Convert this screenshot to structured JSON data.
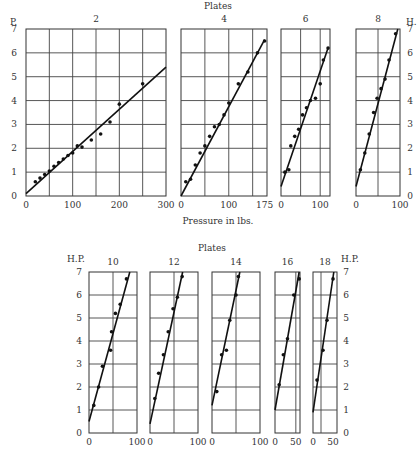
{
  "figure": {
    "top_title": "Plates",
    "bottom_title": "Plates",
    "x_axis_label": "Pressure in lbs.",
    "top_left_axis_label": "P.",
    "top_right_axis_label": "H.",
    "bottom_left_axis_label": "H.P.",
    "bottom_right_axis_label": "H.P.",
    "y_ticks": [
      "0",
      "1",
      "2",
      "3",
      "4",
      "5",
      "6",
      "7"
    ]
  },
  "chart_data": [
    {
      "type": "scatter",
      "title": "2",
      "xlabel": "Pressure in lbs.",
      "ylabel": "P.",
      "xlim": [
        0,
        300
      ],
      "ylim": [
        0,
        7
      ],
      "x_tick_labels": [
        "0",
        "100",
        "200",
        "300"
      ],
      "x_grid": [
        50,
        100,
        150,
        200,
        250
      ],
      "grid": true,
      "points": [
        [
          20,
          0.6
        ],
        [
          30,
          0.75
        ],
        [
          40,
          0.9
        ],
        [
          50,
          1.05
        ],
        [
          60,
          1.25
        ],
        [
          70,
          1.4
        ],
        [
          80,
          1.55
        ],
        [
          90,
          1.7
        ],
        [
          100,
          1.8
        ],
        [
          110,
          2.1
        ],
        [
          120,
          2.05
        ],
        [
          140,
          2.35
        ],
        [
          160,
          2.6
        ],
        [
          180,
          3.1
        ],
        [
          200,
          3.85
        ],
        [
          250,
          4.7
        ]
      ],
      "fit_line": [
        [
          0,
          0.1
        ],
        [
          300,
          5.4
        ]
      ]
    },
    {
      "type": "scatter",
      "title": "4",
      "xlabel": "Pressure in lbs.",
      "xlim": [
        0,
        180
      ],
      "ylim": [
        0,
        7
      ],
      "x_tick_labels": [
        "0",
        "100",
        "175"
      ],
      "x_grid": [
        50,
        100,
        150
      ],
      "grid": true,
      "points": [
        [
          10,
          0.6
        ],
        [
          20,
          0.7
        ],
        [
          30,
          1.3
        ],
        [
          40,
          1.8
        ],
        [
          50,
          2.1
        ],
        [
          60,
          2.5
        ],
        [
          70,
          2.9
        ],
        [
          80,
          3.0
        ],
        [
          90,
          3.4
        ],
        [
          100,
          3.9
        ],
        [
          120,
          4.7
        ],
        [
          140,
          5.2
        ],
        [
          160,
          6.0
        ],
        [
          175,
          6.5
        ]
      ],
      "fit_line": [
        [
          0,
          0.0
        ],
        [
          175,
          6.55
        ]
      ]
    },
    {
      "type": "scatter",
      "title": "6",
      "xlabel": "Pressure in lbs.",
      "xlim": [
        0,
        125
      ],
      "ylim": [
        0,
        7
      ],
      "x_tick_labels": [
        "0",
        "100"
      ],
      "x_grid": [
        50,
        100
      ],
      "grid": true,
      "points": [
        [
          10,
          1.0
        ],
        [
          20,
          1.1
        ],
        [
          25,
          2.1
        ],
        [
          35,
          2.5
        ],
        [
          45,
          2.8
        ],
        [
          55,
          3.4
        ],
        [
          65,
          3.7
        ],
        [
          75,
          4.0
        ],
        [
          88,
          4.1
        ],
        [
          100,
          4.7
        ],
        [
          108,
          5.7
        ],
        [
          120,
          6.2
        ]
      ],
      "fit_line": [
        [
          0,
          0.4
        ],
        [
          120,
          6.2
        ]
      ]
    },
    {
      "type": "scatter",
      "title": "8",
      "xlabel": "Pressure in lbs.",
      "xlim": [
        0,
        100
      ],
      "ylim": [
        0,
        7
      ],
      "x_tick_labels": [
        "0",
        "100"
      ],
      "x_grid": [
        50
      ],
      "grid": true,
      "points": [
        [
          10,
          1.1
        ],
        [
          20,
          1.8
        ],
        [
          30,
          2.6
        ],
        [
          40,
          3.5
        ],
        [
          48,
          4.1
        ],
        [
          57,
          4.5
        ],
        [
          66,
          4.9
        ],
        [
          75,
          5.7
        ],
        [
          90,
          6.8
        ]
      ],
      "fit_line": [
        [
          0,
          0.4
        ],
        [
          95,
          7.0
        ]
      ]
    },
    {
      "type": "scatter",
      "title": "10",
      "ylabel": "H.P.",
      "xlim": [
        0,
        100
      ],
      "ylim": [
        0,
        7
      ],
      "x_tick_labels": [
        "0",
        "100"
      ],
      "x_grid": [
        50
      ],
      "grid": true,
      "points": [
        [
          10,
          1.2
        ],
        [
          20,
          2.0
        ],
        [
          28,
          2.9
        ],
        [
          45,
          3.6
        ],
        [
          47,
          4.4
        ],
        [
          55,
          5.2
        ],
        [
          65,
          5.6
        ],
        [
          78,
          6.7
        ]
      ],
      "fit_line": [
        [
          0,
          0.5
        ],
        [
          85,
          7.0
        ]
      ]
    },
    {
      "type": "scatter",
      "title": "12",
      "xlim": [
        0,
        100
      ],
      "ylim": [
        0,
        7
      ],
      "x_tick_labels": [
        "0",
        "100"
      ],
      "x_grid": [
        50
      ],
      "grid": true,
      "points": [
        [
          10,
          1.5
        ],
        [
          18,
          2.6
        ],
        [
          28,
          3.4
        ],
        [
          38,
          4.4
        ],
        [
          48,
          5.4
        ],
        [
          57,
          5.9
        ],
        [
          67,
          6.8
        ]
      ],
      "fit_line": [
        [
          0,
          0.4
        ],
        [
          68,
          7.0
        ]
      ]
    },
    {
      "type": "scatter",
      "title": "14",
      "xlim": [
        0,
        100
      ],
      "ylim": [
        0,
        7
      ],
      "x_tick_labels": [
        "0",
        "100"
      ],
      "x_grid": [
        50
      ],
      "grid": true,
      "points": [
        [
          10,
          1.8
        ],
        [
          20,
          3.4
        ],
        [
          30,
          3.6
        ],
        [
          37,
          4.9
        ],
        [
          50,
          6.0
        ],
        [
          55,
          6.8
        ]
      ],
      "fit_line": [
        [
          0,
          1.2
        ],
        [
          58,
          7.0
        ]
      ]
    },
    {
      "type": "scatter",
      "title": "16",
      "xlim": [
        0,
        60
      ],
      "ylim": [
        0,
        7
      ],
      "x_tick_labels": [
        "0",
        "50"
      ],
      "x_grid": [
        50
      ],
      "grid": true,
      "points": [
        [
          10,
          2.1
        ],
        [
          20,
          3.4
        ],
        [
          30,
          4.1
        ],
        [
          45,
          6.0
        ],
        [
          58,
          6.7
        ]
      ],
      "fit_line": [
        [
          0,
          1.0
        ],
        [
          58,
          7.0
        ]
      ]
    },
    {
      "type": "scatter",
      "title": "18",
      "xlim": [
        0,
        60
      ],
      "ylim": [
        0,
        7
      ],
      "x_tick_labels": [
        "0",
        "50"
      ],
      "x_grid": [
        20
      ],
      "grid": true,
      "points": [
        [
          10,
          2.3
        ],
        [
          25,
          3.6
        ],
        [
          35,
          4.9
        ],
        [
          50,
          6.7
        ]
      ],
      "fit_line": [
        [
          0,
          0.9
        ],
        [
          52,
          7.0
        ]
      ]
    }
  ],
  "layout": {
    "panels": [
      {
        "x0": 26,
        "x1": 166,
        "y0": 29,
        "y1": 196
      },
      {
        "x0": 181,
        "x1": 267,
        "y0": 29,
        "y1": 196
      },
      {
        "x0": 281,
        "x1": 330,
        "y0": 29,
        "y1": 196
      },
      {
        "x0": 356,
        "x1": 400,
        "y0": 29,
        "y1": 196
      },
      {
        "x0": 89,
        "x1": 137,
        "y0": 272,
        "y1": 433
      },
      {
        "x0": 150,
        "x1": 198,
        "y0": 272,
        "y1": 433
      },
      {
        "x0": 212,
        "x1": 260,
        "y0": 272,
        "y1": 433
      },
      {
        "x0": 275,
        "x1": 300,
        "y0": 272,
        "y1": 433
      },
      {
        "x0": 313,
        "x1": 337,
        "y0": 272,
        "y1": 433
      }
    ]
  }
}
